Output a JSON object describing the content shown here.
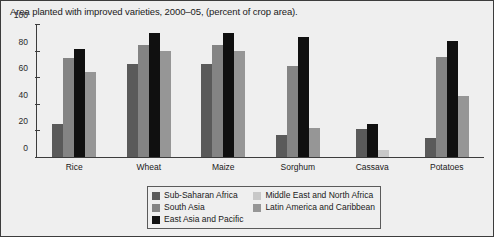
{
  "title": "Area planted with improved varieties, 2000–05, (percent of crop area).",
  "axis": {
    "y_ticks": [
      "0",
      "20",
      "40",
      "60",
      "80",
      "100"
    ]
  },
  "legend": {
    "column_left": [
      {
        "label": "Sub-Saharan Africa",
        "color": "#5a5a5a"
      },
      {
        "label": "South Asia",
        "color": "#848484"
      },
      {
        "label": "East Asia and Pacific",
        "color": "#101010"
      }
    ],
    "column_right": [
      {
        "label": "Middle East and North Africa",
        "color": "#c8c8c8"
      },
      {
        "label": "Latin America and Caribbean",
        "color": "#969696"
      }
    ]
  },
  "chart_data": {
    "type": "bar",
    "title": "Area planted with improved varieties, 2000–05, (percent of crop area).",
    "xlabel": "",
    "ylabel": "",
    "ylim": [
      0,
      100
    ],
    "yticks": [
      0,
      20,
      40,
      60,
      80,
      100
    ],
    "grid": false,
    "legend_position": "bottom-center",
    "categories": [
      "Rice",
      "Wheat",
      "Maize",
      "Sorghum",
      "Cassava",
      "Potatoes"
    ],
    "series": [
      {
        "name": "Sub-Saharan Africa",
        "color": "#5a5a5a",
        "values": [
          25,
          70,
          70,
          16,
          21,
          14
        ]
      },
      {
        "name": "South Asia",
        "color": "#848484",
        "values": [
          75,
          85,
          85,
          69,
          null,
          76
        ]
      },
      {
        "name": "East Asia and Pacific",
        "color": "#101010",
        "values": [
          82,
          94,
          94,
          91,
          25,
          88
        ]
      },
      {
        "name": "Middle East and North Africa",
        "color": "#c8c8c8",
        "values": [
          null,
          null,
          null,
          null,
          5,
          null
        ]
      },
      {
        "name": "Latin America and Caribbean",
        "color": "#969696",
        "values": [
          64,
          80,
          80,
          22,
          null,
          46
        ]
      }
    ]
  }
}
